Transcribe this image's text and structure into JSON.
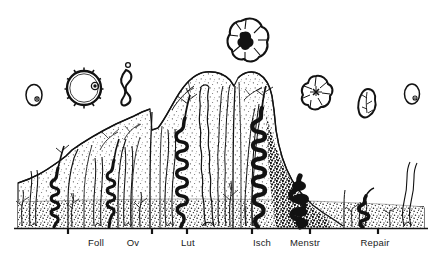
{
  "figure": {
    "type": "diagram",
    "background_color": "#ffffff",
    "ink_color": "#121212",
    "stroke_color": "#1a1a1a",
    "baseline_y": 228,
    "width": 440,
    "height": 257
  },
  "axis": {
    "baseline_label": "",
    "ticks": [
      {
        "id": "tick-foll",
        "x": 68
      },
      {
        "id": "tick-ov",
        "x": 152
      },
      {
        "id": "tick-lut",
        "x": 187
      },
      {
        "id": "tick-isch",
        "x": 252
      },
      {
        "id": "tick-menstr",
        "x": 310
      },
      {
        "id": "tick-repair",
        "x": 378
      }
    ],
    "labels": [
      {
        "id": "label-foll",
        "text": "Foll",
        "x": 96,
        "y": 243
      },
      {
        "id": "label-ov",
        "text": "Ov",
        "x": 133,
        "y": 243
      },
      {
        "id": "label-lut",
        "text": "Lut",
        "x": 188,
        "y": 243
      },
      {
        "id": "label-isch",
        "text": "Isch",
        "x": 262,
        "y": 243
      },
      {
        "id": "label-menstr",
        "text": "Menstr",
        "x": 303,
        "y": 243
      },
      {
        "id": "label-repair",
        "text": "Repair",
        "x": 374,
        "y": 243
      }
    ]
  },
  "ovary_row": {
    "caption": "",
    "structures": [
      {
        "id": "primordial-follicle-left",
        "name": "primordial follicle",
        "cx": 34,
        "cy": 95,
        "rx": 8,
        "ry": 10.5
      },
      {
        "id": "graafian-follicle",
        "name": "graafian follicle",
        "cx": 84,
        "cy": 88,
        "rx": 17,
        "ry": 17
      },
      {
        "id": "ruptured-follicle",
        "name": "ruptured follicle",
        "cx": 127,
        "cy": 87,
        "rx": 9,
        "ry": 17
      },
      {
        "id": "corpus-luteum-peak",
        "name": "corpus luteum",
        "cx": 246,
        "cy": 39,
        "rx": 19,
        "ry": 20
      },
      {
        "id": "corpus-luteum-regressing",
        "name": "regressing corpus luteum",
        "cx": 316,
        "cy": 92,
        "rx": 15,
        "ry": 16
      },
      {
        "id": "corpus-albicans",
        "name": "corpus albicans",
        "cx": 368,
        "cy": 104,
        "rx": 9,
        "ry": 15
      },
      {
        "id": "primordial-follicle-right",
        "name": "primordial follicle",
        "cx": 412,
        "cy": 94,
        "rx": 7.5,
        "ry": 10
      }
    ]
  },
  "endometrium": {
    "phases": [
      {
        "id": "phase-follicular",
        "name": "Follicular / proliferative",
        "x_start": 18,
        "x_end": 152,
        "height_desc": "rising"
      },
      {
        "id": "phase-ovulation",
        "name": "Ovulation",
        "x_start": 152,
        "x_end": 187,
        "height_desc": "mid"
      },
      {
        "id": "phase-luteal",
        "name": "Luteal / secretory",
        "x_start": 187,
        "x_end": 252,
        "height_desc": "maximum"
      },
      {
        "id": "phase-ischemic",
        "name": "Ischemic",
        "x_start": 252,
        "x_end": 290,
        "height_desc": "declining"
      },
      {
        "id": "phase-menstrual",
        "name": "Menstrual",
        "x_start": 290,
        "x_end": 340,
        "height_desc": "shedding"
      },
      {
        "id": "phase-repair",
        "name": "Repair",
        "x_start": 340,
        "x_end": 425,
        "height_desc": "thin, regenerating"
      }
    ],
    "layers": [
      {
        "id": "functional-layer",
        "name": "functional layer",
        "tone": "light stipple"
      },
      {
        "id": "basal-layer",
        "name": "basal layer",
        "tone": "dense stipple"
      }
    ],
    "features": [
      {
        "id": "spiral-arteries",
        "name": "spiral arteries"
      },
      {
        "id": "endometrial-glands",
        "name": "endometrial glands"
      },
      {
        "id": "straight-arteries",
        "name": "straight basal arteries"
      },
      {
        "id": "hemorrhage-zone",
        "name": "hemorrhage / breakdown"
      }
    ]
  }
}
